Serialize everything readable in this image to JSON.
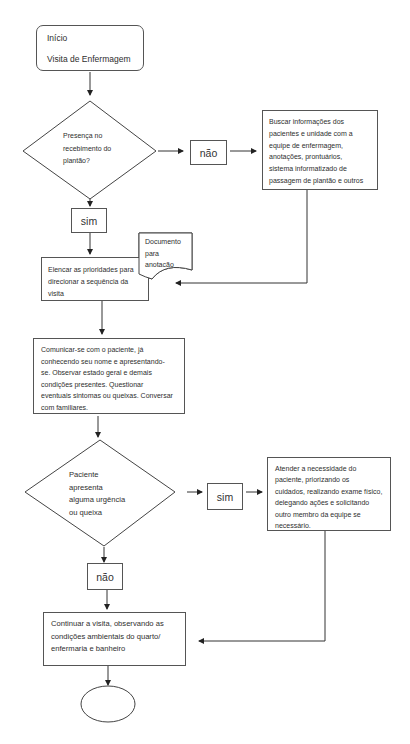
{
  "flowchart": {
    "start": {
      "line1": "Início",
      "line2": "Visita de Enfermagem"
    },
    "decision1": {
      "lines": [
        "Presença no",
        "recebimento do",
        "plantão?"
      ]
    },
    "decision1_no": "não",
    "decision1_yes": "sim",
    "search_info": {
      "lines": [
        "Buscar informações dos",
        "pacientes e unidade com a",
        "equipe de enfermagem,",
        "anotações, prontuários,",
        "sistema informatizado de",
        "passagem de plantão e outros"
      ]
    },
    "document": {
      "lines": [
        "Documento",
        "para",
        "anotacão"
      ]
    },
    "prioritize": {
      "lines": [
        "Elencar as prioridades para",
        "direcionar a sequência da",
        "visita"
      ]
    },
    "communicate": {
      "lines": [
        "Comunicar-se com o paciente, já",
        "conhecendo seu nome e apresentando-",
        "se.  Observar estado geral e demais",
        "condições presentes. Questionar",
        "eventuais sintomas ou queixas. Conversar",
        "com familiares."
      ]
    },
    "decision2": {
      "lines": [
        "Paciente",
        "apresenta",
        "alguma urgência",
        "ou queixa"
      ]
    },
    "decision2_yes": "sim",
    "decision2_no": "não",
    "attend": {
      "lines": [
        "Atender a necessidade do",
        "paciente, priorizando os",
        "cuidados, realizando exame físico,",
        "delegando ações e solicitando",
        "outro membro da equipe se",
        "necessário."
      ]
    },
    "continue": {
      "lines": [
        "Continuar a visita, observando as",
        "condições ambientais do quarto/",
        "enfermaria e banheiro"
      ]
    },
    "end": {
      "label": ""
    }
  }
}
